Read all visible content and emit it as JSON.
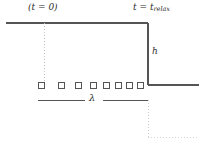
{
  "figure": {
    "width": 203,
    "height": 145,
    "background": "#ffffff",
    "line_color": "#555555",
    "dotted_color": "#bbbbbb",
    "text_color": "#2b2b2b"
  },
  "labels": {
    "left_time": "(t = 0)",
    "right_time_prefix": "t = t",
    "right_time_subscript": "relax",
    "height": "h",
    "wavelength": "λ"
  },
  "geometry": {
    "top_surface": {
      "x1": 6,
      "y1": 23,
      "x2": 148,
      "y2": 23
    },
    "step_riser": {
      "x1": 148,
      "y1": 23,
      "x2": 148,
      "y2": 85
    },
    "lower_surface": {
      "x1": 148,
      "y1": 85,
      "x2": 199,
      "y2": 85
    },
    "dotted_left": {
      "x": 44,
      "y1": 23,
      "y2": 85
    },
    "dotted_right": {
      "x": 148,
      "y1": 100,
      "y2": 137
    },
    "dotted_bottom": {
      "x1": 148,
      "y1": 137,
      "x2": 199,
      "y2": 137
    },
    "lambda_rule_left": {
      "x1": 38,
      "y1": 100,
      "x2": 85,
      "y2": 100
    },
    "lambda_rule_right": {
      "x1": 103,
      "y1": 100,
      "x2": 148,
      "y2": 100
    },
    "marker_row_y": 85,
    "marker_size": 6,
    "marker_x_positions": [
      41,
      61,
      78,
      93,
      106,
      118,
      129,
      140
    ]
  }
}
